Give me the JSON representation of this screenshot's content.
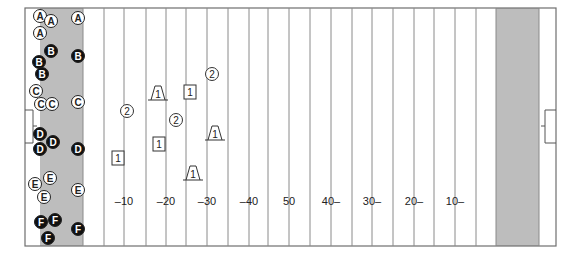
{
  "diagram": {
    "colors": {
      "field": "#ffffff",
      "endzone_shade": "#bdbdbd",
      "line": "#8a8a8a",
      "border": "#6e6e6e",
      "dark_player": "#111111",
      "light_player": "#ffffff"
    },
    "yard_labels": [
      "–10",
      "–20",
      "–30",
      "–40",
      "50",
      "40–",
      "30–",
      "20–",
      "10–"
    ],
    "players": [
      {
        "label": "A",
        "style": "light",
        "group": "A"
      },
      {
        "label": "A",
        "style": "light",
        "group": "A"
      },
      {
        "label": "A",
        "style": "light",
        "group": "A"
      },
      {
        "label": "A",
        "style": "light",
        "group": "A"
      },
      {
        "label": "B",
        "style": "dark",
        "group": "B"
      },
      {
        "label": "B",
        "style": "dark",
        "group": "B"
      },
      {
        "label": "B",
        "style": "dark",
        "group": "B"
      },
      {
        "label": "B",
        "style": "dark",
        "group": "B"
      },
      {
        "label": "C",
        "style": "light",
        "group": "C"
      },
      {
        "label": "C",
        "style": "light",
        "group": "C"
      },
      {
        "label": "C",
        "style": "light",
        "group": "C"
      },
      {
        "label": "C",
        "style": "light",
        "group": "C"
      },
      {
        "label": "D",
        "style": "dark",
        "group": "D"
      },
      {
        "label": "D",
        "style": "dark",
        "group": "D"
      },
      {
        "label": "D",
        "style": "dark",
        "group": "D"
      },
      {
        "label": "D",
        "style": "dark",
        "group": "D"
      },
      {
        "label": "E",
        "style": "light",
        "group": "E"
      },
      {
        "label": "E",
        "style": "light",
        "group": "E"
      },
      {
        "label": "E",
        "style": "light",
        "group": "E"
      },
      {
        "label": "E",
        "style": "light",
        "group": "E"
      },
      {
        "label": "F",
        "style": "dark",
        "group": "F"
      },
      {
        "label": "F",
        "style": "dark",
        "group": "F"
      },
      {
        "label": "F",
        "style": "dark",
        "group": "F"
      },
      {
        "label": "F",
        "style": "dark",
        "group": "F"
      }
    ],
    "markers": [
      {
        "type": "circle",
        "label": "2"
      },
      {
        "type": "circle",
        "label": "2"
      },
      {
        "type": "circle",
        "label": "2"
      },
      {
        "type": "square",
        "label": "1"
      },
      {
        "type": "square",
        "label": "1"
      },
      {
        "type": "square",
        "label": "1"
      },
      {
        "type": "cone",
        "label": "1"
      },
      {
        "type": "cone",
        "label": "1"
      },
      {
        "type": "cone",
        "label": "1"
      }
    ]
  }
}
